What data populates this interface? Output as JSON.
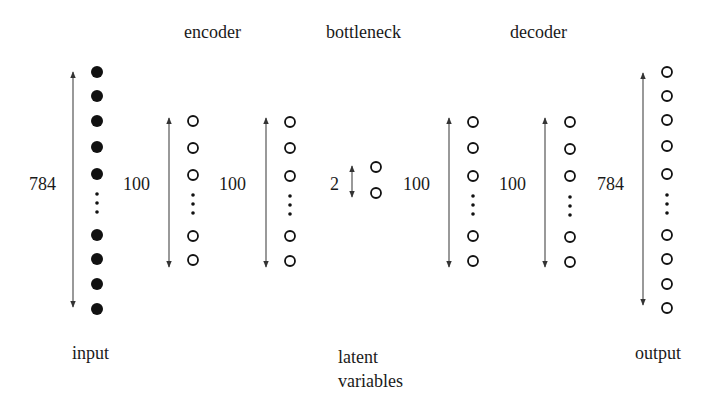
{
  "headings": {
    "encoder": "encoder",
    "bottleneck": "bottleneck",
    "decoder": "decoder"
  },
  "bottom_labels": {
    "input": "input",
    "latent_line1": "latent",
    "latent_line2": "variables",
    "output": "output"
  },
  "colors": {
    "ink": "#1a1a1a",
    "arrow": "#4a4a4a",
    "background": "#ffffff"
  },
  "layers": [
    {
      "id": "input",
      "size_label": "784",
      "node_style": "filled",
      "visible_nodes_top": 5,
      "visible_nodes_bottom": 4,
      "ellipsis": true
    },
    {
      "id": "encoder-hidden-1",
      "size_label": "100",
      "node_style": "open",
      "visible_nodes_top": 3,
      "visible_nodes_bottom": 2,
      "ellipsis": true
    },
    {
      "id": "encoder-hidden-2",
      "size_label": "100",
      "node_style": "open",
      "visible_nodes_top": 3,
      "visible_nodes_bottom": 2,
      "ellipsis": true
    },
    {
      "id": "bottleneck",
      "size_label": "2",
      "node_style": "open",
      "visible_nodes_top": 2,
      "visible_nodes_bottom": 0,
      "ellipsis": false
    },
    {
      "id": "decoder-hidden-1",
      "size_label": "100",
      "node_style": "open",
      "visible_nodes_top": 3,
      "visible_nodes_bottom": 2,
      "ellipsis": true
    },
    {
      "id": "decoder-hidden-2",
      "size_label": "100",
      "node_style": "open",
      "visible_nodes_top": 3,
      "visible_nodes_bottom": 2,
      "ellipsis": true
    },
    {
      "id": "output",
      "size_label": "784",
      "node_style": "open",
      "visible_nodes_top": 5,
      "visible_nodes_bottom": 4,
      "ellipsis": true
    }
  ]
}
